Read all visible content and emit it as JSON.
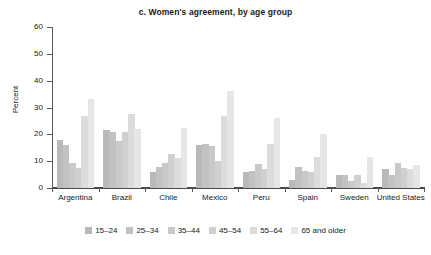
{
  "chart_data": {
    "type": "bar",
    "title": "c. Women's agreement, by age group",
    "xlabel": "",
    "ylabel": "Percent",
    "ylim": [
      0,
      60
    ],
    "yticks": [
      0,
      10,
      20,
      30,
      40,
      50,
      60
    ],
    "ytick_labels": [
      "0",
      "10",
      "20",
      "30",
      "40",
      "50",
      "60"
    ],
    "grid": false,
    "legend_position": "bottom",
    "categories": [
      "Argentina",
      "Brazil",
      "Chile",
      "Mexico",
      "Peru",
      "Spain",
      "Sweden",
      "United States"
    ],
    "series": [
      {
        "name": "15–24",
        "color": "#b9b9b9",
        "values": [
          18.0,
          21.5,
          6.0,
          16.0,
          6.0,
          3.0,
          5.0,
          7.0
        ]
      },
      {
        "name": "25–34",
        "color": "#c2c2c2",
        "values": [
          16.0,
          21.0,
          8.0,
          16.5,
          6.5,
          8.0,
          5.0,
          5.0
        ]
      },
      {
        "name": "35–44",
        "color": "#c9c9c9",
        "values": [
          9.5,
          17.5,
          9.5,
          15.5,
          9.0,
          6.5,
          2.5,
          9.5
        ]
      },
      {
        "name": "45–54",
        "color": "#d0d0d0",
        "values": [
          7.5,
          21.0,
          12.5,
          10.0,
          7.0,
          6.0,
          5.0,
          7.5
        ]
      },
      {
        "name": "55–64",
        "color": "#dcdcdc",
        "values": [
          27.0,
          27.5,
          11.0,
          27.0,
          16.5,
          11.5,
          2.0,
          7.0
        ]
      },
      {
        "name": "65 and older",
        "color": "#e6e6e6",
        "values": [
          33.0,
          22.0,
          22.5,
          36.0,
          26.0,
          20.0,
          11.5,
          8.5
        ]
      }
    ]
  },
  "colors": {
    "axis": "#5b5b5b",
    "text": "#1a1a1a",
    "background": "#ffffff"
  }
}
